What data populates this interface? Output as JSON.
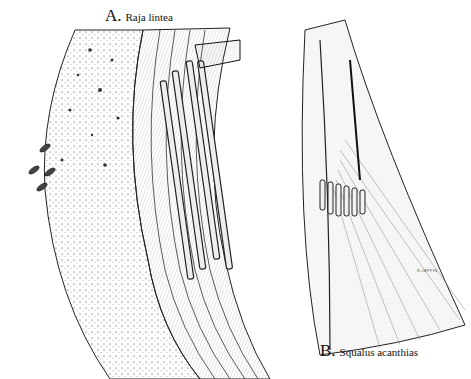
{
  "figure": {
    "panel_a": {
      "letter": "A.",
      "species": "Raja lintea"
    },
    "panel_b": {
      "letter": "B.",
      "species": "Squalus acanthias"
    },
    "signature": "R.JEPPIN",
    "colors": {
      "ink": "#111111",
      "background": "#ffffff"
    }
  }
}
